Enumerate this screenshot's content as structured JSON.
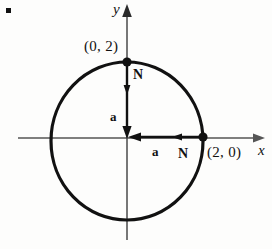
{
  "figure": {
    "kind": "math-diagram",
    "background_color": "#fdfdfc",
    "ink_color": "#111111",
    "axis_color": "#555555",
    "bullet": {
      "name": "item-bullet",
      "shape": "square"
    },
    "axes": {
      "x_label": "x",
      "y_label": "y",
      "origin": {
        "x": 127,
        "y": 138
      }
    },
    "circle": {
      "center": {
        "x": 127,
        "y": 141
      },
      "radius_x": 76,
      "radius_y": 79,
      "stroke_width": 3
    },
    "points": [
      {
        "id": "top",
        "label": "(0, 2)",
        "cx": 127,
        "cy": 62
      },
      {
        "id": "right",
        "label": "(2, 0)",
        "cx": 203,
        "cy": 137
      }
    ],
    "vectors": [
      {
        "id": "normal-top",
        "symbol": "N",
        "from": {
          "x": 127,
          "y": 62
        },
        "to": {
          "x": 127,
          "y": 93
        }
      },
      {
        "id": "a-vertical",
        "symbol": "a",
        "from": {
          "x": 127,
          "y": 62
        },
        "to": {
          "x": 127,
          "y": 138
        }
      },
      {
        "id": "normal-right",
        "symbol": "N",
        "from": {
          "x": 203,
          "y": 137
        },
        "to": {
          "x": 172,
          "y": 137
        }
      },
      {
        "id": "a-horizontal",
        "symbol": "a",
        "from": {
          "x": 203,
          "y": 137
        },
        "to": {
          "x": 128,
          "y": 137
        }
      }
    ],
    "labels": {
      "point_top": "(0, 2)",
      "point_right": "(2, 0)",
      "normal_top": "N",
      "normal_right": "N",
      "a_vertical": "a",
      "a_horizontal": "a",
      "axis_x": "x",
      "axis_y": "y"
    }
  }
}
